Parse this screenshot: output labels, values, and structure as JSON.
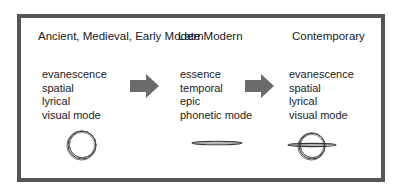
{
  "diagram": {
    "columns": [
      {
        "heading": "Ancient, Medieval, Early Modern",
        "items": [
          "evanescence",
          "spatial",
          "lyrical",
          "visual mode"
        ],
        "symbol": "circle-icon"
      },
      {
        "heading": "Late Modern",
        "items": [
          "essence",
          "temporal",
          "epic",
          "phonetic mode"
        ],
        "symbol": "line-icon"
      },
      {
        "heading": "Contemporary",
        "items": [
          "evanescence",
          "spatial",
          "lyrical",
          "visual mode"
        ],
        "symbol": "circle-with-line-icon"
      }
    ],
    "arrows": [
      "right-arrow-icon",
      "right-arrow-icon"
    ],
    "colors": {
      "border": "#555555",
      "arrow": "#6b6b6b",
      "text": "#1a1a1a",
      "stroke": "#333333"
    }
  }
}
